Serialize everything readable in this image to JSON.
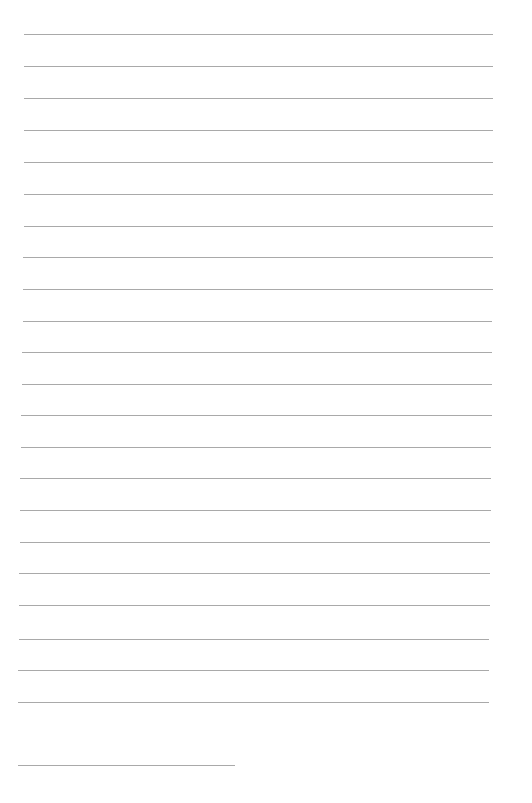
{
  "page": {
    "type": "lined-paper",
    "line_color": "#a9a9a9",
    "background": "#ffffff",
    "lines": [
      {
        "y": 34,
        "x1": 24,
        "x2": 493
      },
      {
        "y": 66,
        "x1": 24,
        "x2": 493
      },
      {
        "y": 98,
        "x1": 24,
        "x2": 493
      },
      {
        "y": 130,
        "x1": 24,
        "x2": 493
      },
      {
        "y": 162,
        "x1": 24,
        "x2": 493
      },
      {
        "y": 194,
        "x1": 24,
        "x2": 493
      },
      {
        "y": 226,
        "x1": 24,
        "x2": 493
      },
      {
        "y": 257,
        "x1": 23,
        "x2": 493
      },
      {
        "y": 289,
        "x1": 23,
        "x2": 493
      },
      {
        "y": 321,
        "x1": 23,
        "x2": 492
      },
      {
        "y": 352,
        "x1": 22,
        "x2": 492
      },
      {
        "y": 384,
        "x1": 22,
        "x2": 492
      },
      {
        "y": 415,
        "x1": 21,
        "x2": 492
      },
      {
        "y": 447,
        "x1": 21,
        "x2": 491
      },
      {
        "y": 478,
        "x1": 20,
        "x2": 491
      },
      {
        "y": 510,
        "x1": 20,
        "x2": 491
      },
      {
        "y": 542,
        "x1": 20,
        "x2": 490
      },
      {
        "y": 573,
        "x1": 19,
        "x2": 490
      },
      {
        "y": 605,
        "x1": 19,
        "x2": 490
      },
      {
        "y": 639,
        "x1": 19,
        "x2": 489
      },
      {
        "y": 670,
        "x1": 18,
        "x2": 489
      },
      {
        "y": 702,
        "x1": 18,
        "x2": 489
      },
      {
        "y": 765,
        "x1": 18,
        "x2": 235
      }
    ]
  }
}
